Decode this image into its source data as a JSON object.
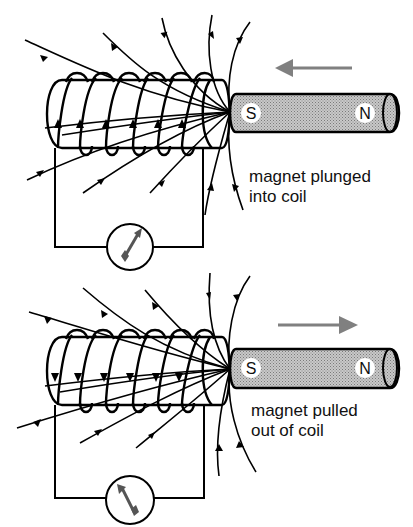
{
  "colors": {
    "line": "#000000",
    "motion_arrow": "#808080",
    "magnet_fill": "#b8b8b8",
    "pole_label_bg": "#ffffff"
  },
  "panels": [
    {
      "id": "top",
      "caption_line1": "magnet plunged",
      "caption_line2": "into coil",
      "magnet": {
        "left_pole": "S",
        "right_pole": "N"
      },
      "motion_direction": "left",
      "coil_current_arrows": "up",
      "galvanometer_needle": "deflected-right",
      "icons": [
        "coil-icon",
        "bar-magnet-icon",
        "galvanometer-icon",
        "motion-arrow-left-icon",
        "field-lines-icon"
      ]
    },
    {
      "id": "bottom",
      "caption_line1": "magnet pulled",
      "caption_line2": "out of coil",
      "magnet": {
        "left_pole": "S",
        "right_pole": "N"
      },
      "motion_direction": "right",
      "coil_current_arrows": "down",
      "galvanometer_needle": "deflected-left",
      "icons": [
        "coil-icon",
        "bar-magnet-icon",
        "galvanometer-icon",
        "motion-arrow-right-icon",
        "field-lines-icon"
      ]
    }
  ]
}
